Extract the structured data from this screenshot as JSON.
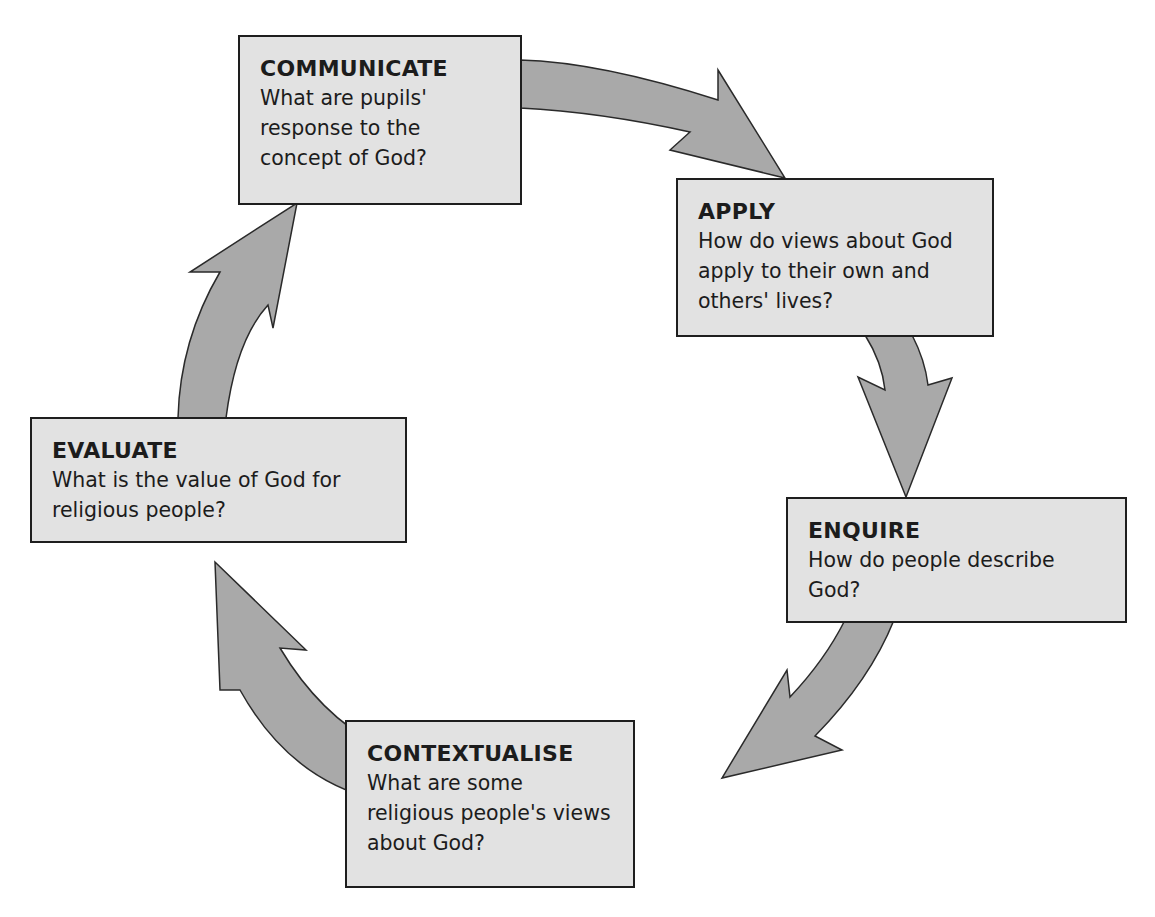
{
  "diagram": {
    "type": "cycle",
    "colors": {
      "box_fill": "#e2e2e2",
      "box_border": "#1e1e1e",
      "arrow_fill": "#a9a9a9",
      "arrow_stroke": "#2a2a2a"
    },
    "stages": [
      {
        "id": "communicate",
        "title": "COMMUNICATE",
        "question": "What are pupils' response to the concept of God?"
      },
      {
        "id": "apply",
        "title": "APPLY",
        "question": "How do views about God apply to their own and others' lives?"
      },
      {
        "id": "enquire",
        "title": "ENQUIRE",
        "question": "How do people describe God?"
      },
      {
        "id": "contextualise",
        "title": "CONTEXTUALISE",
        "question": "What are some religious people's views about God?"
      },
      {
        "id": "evaluate",
        "title": "EVALUATE",
        "question": "What is the value of God for religious people?"
      }
    ],
    "arrows": [
      {
        "from": "communicate",
        "to": "apply"
      },
      {
        "from": "apply",
        "to": "enquire"
      },
      {
        "from": "enquire",
        "to": "contextualise"
      },
      {
        "from": "contextualise",
        "to": "evaluate"
      },
      {
        "from": "evaluate",
        "to": "communicate"
      }
    ]
  }
}
